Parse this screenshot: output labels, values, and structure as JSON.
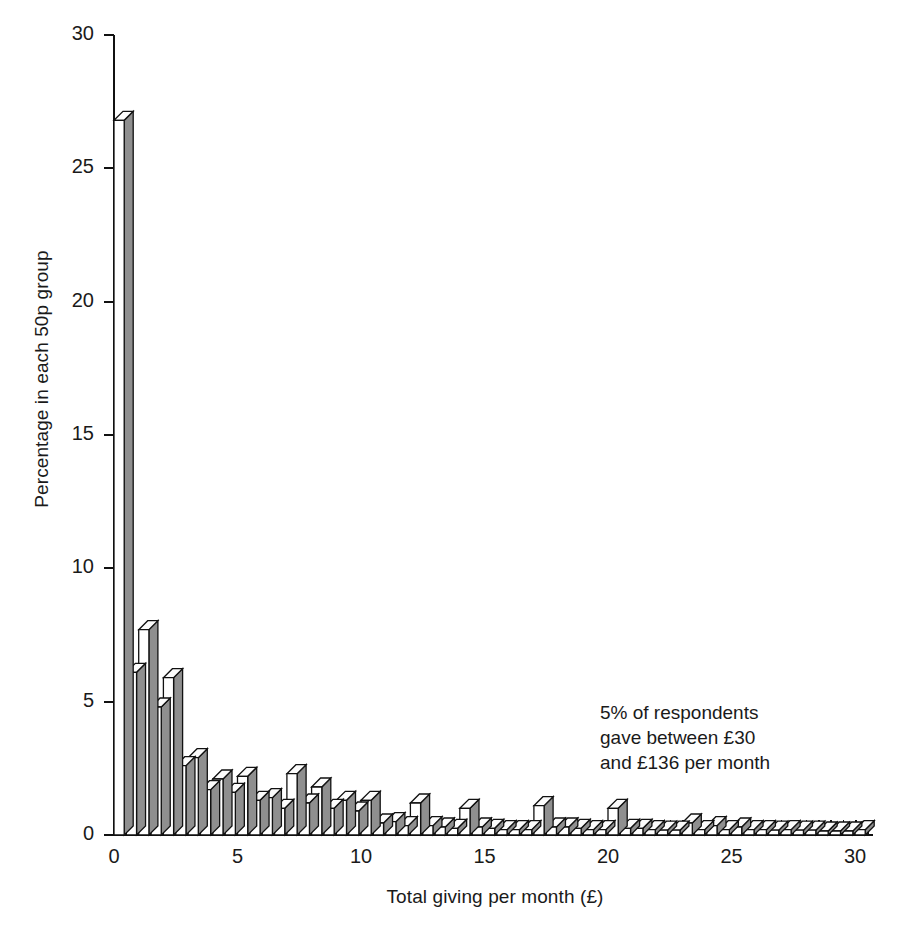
{
  "chart_data": {
    "type": "bar",
    "title": "",
    "subtitle": "",
    "xlabel": "Total giving per month (£)",
    "ylabel": "Percentage in each 50p group",
    "xlim": [
      0,
      30.5
    ],
    "ylim": [
      0,
      30
    ],
    "grid": false,
    "legend": null,
    "bin_width": 0.5,
    "bar_style": "3d-isometric-white-front-grey-side",
    "x_tick_labels": [
      "0",
      "5",
      "10",
      "15",
      "20",
      "25",
      "30"
    ],
    "x_tick_values": [
      0,
      5,
      10,
      15,
      20,
      25,
      30
    ],
    "y_tick_labels": [
      "0",
      "5",
      "10",
      "15",
      "20",
      "25",
      "30"
    ],
    "y_tick_values": [
      0,
      5,
      10,
      15,
      20,
      25,
      30
    ],
    "x_minor_tick_interval": 0.5,
    "categories": [
      "0.0",
      "0.5",
      "1.0",
      "1.5",
      "2.0",
      "2.5",
      "3.0",
      "3.5",
      "4.0",
      "4.5",
      "5.0",
      "5.5",
      "6.0",
      "6.5",
      "7.0",
      "7.5",
      "8.0",
      "8.5",
      "9.0",
      "9.5",
      "10.0",
      "10.5",
      "11.0",
      "11.5",
      "12.0",
      "12.5",
      "13.0",
      "13.5",
      "14.0",
      "14.5",
      "15.0",
      "15.5",
      "16.0",
      "16.5",
      "17.0",
      "17.5",
      "18.0",
      "18.5",
      "19.0",
      "19.5",
      "20.0",
      "20.5",
      "21.0",
      "21.5",
      "22.0",
      "22.5",
      "23.0",
      "23.5",
      "24.0",
      "24.5",
      "25.0",
      "25.5",
      "26.0",
      "26.5",
      "27.0",
      "27.5",
      "28.0",
      "28.5",
      "29.0",
      "29.5",
      "30.0"
    ],
    "values": [
      26.8,
      6.1,
      7.7,
      4.8,
      5.9,
      2.6,
      2.9,
      1.7,
      2.1,
      1.6,
      2.2,
      1.3,
      1.4,
      1.0,
      2.3,
      1.2,
      1.8,
      1.0,
      1.3,
      0.9,
      1.3,
      0.45,
      0.5,
      0.35,
      1.2,
      0.35,
      0.3,
      0.25,
      1.0,
      0.3,
      0.25,
      0.2,
      0.2,
      0.2,
      1.1,
      0.3,
      0.3,
      0.25,
      0.2,
      0.2,
      1.0,
      0.25,
      0.25,
      0.2,
      0.18,
      0.18,
      0.45,
      0.2,
      0.35,
      0.2,
      0.3,
      0.2,
      0.2,
      0.18,
      0.2,
      0.18,
      0.18,
      0.15,
      0.15,
      0.15,
      0.2
    ],
    "annotation": "5% of respondents\ngave between £30\nand £136 per month"
  },
  "colors": {
    "bar_front": "#ffffff",
    "bar_side": "#8f8f8f",
    "bar_outline": "#111111",
    "axis": "#111111",
    "text": "#1a1a1a",
    "background": "#ffffff"
  }
}
